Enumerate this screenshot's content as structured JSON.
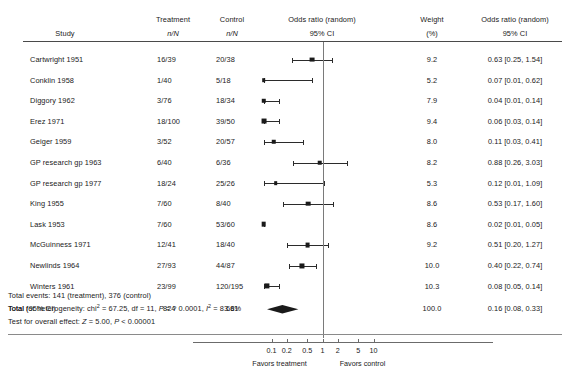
{
  "columns": {
    "study": "Study",
    "treatment_l1": "Treatment",
    "treatment_l2": "n/N",
    "control_l1": "Control",
    "control_l2": "n/N",
    "plot_l1": "Odds ratio (random)",
    "plot_l2": "95% CI",
    "weight_l1": "Weight",
    "weight_l2": "(%)",
    "or_l1": "Odds ratio (random)",
    "or_l2": "95% CI"
  },
  "rows": [
    {
      "study": "Cartwright 1951",
      "treatment": "16/39",
      "control": "20/38",
      "weight": "9.2",
      "or_text": "0.63 [0.25, 1.54]",
      "or": 0.63,
      "lcl": 0.25,
      "ucl": 1.54,
      "w": 9.2
    },
    {
      "study": "Conklin 1958",
      "treatment": "1/40",
      "control": "5/18",
      "weight": "5.2",
      "or_text": "0.07 [0.01, 0.62]",
      "or": 0.07,
      "lcl": 0.01,
      "ucl": 0.62,
      "w": 5.2
    },
    {
      "study": "Diggory 1962",
      "treatment": "3/76",
      "control": "18/34",
      "weight": "7.9",
      "or_text": "0.04 [0.01, 0.14]",
      "or": 0.04,
      "lcl": 0.01,
      "ucl": 0.14,
      "w": 7.9
    },
    {
      "study": "Erez 1971",
      "treatment": "18/100",
      "control": "39/50",
      "weight": "9.4",
      "or_text": "0.06 [0.03, 0.14]",
      "or": 0.06,
      "lcl": 0.03,
      "ucl": 0.14,
      "w": 9.4
    },
    {
      "study": "Geiger 1959",
      "treatment": "3/52",
      "control": "20/57",
      "weight": "8.0",
      "or_text": "0.11 [0.03, 0.41]",
      "or": 0.11,
      "lcl": 0.03,
      "ucl": 0.41,
      "w": 8.0
    },
    {
      "study": "GP research gp 1963",
      "treatment": "6/40",
      "control": "6/36",
      "weight": "8.2",
      "or_text": "0.88 [0.26, 3.03]",
      "or": 0.88,
      "lcl": 0.26,
      "ucl": 3.03,
      "w": 8.2
    },
    {
      "study": "GP research gp 1977",
      "treatment": "18/24",
      "control": "25/26",
      "weight": "5.3",
      "or_text": "0.12 [0.01, 1.09]",
      "or": 0.12,
      "lcl": 0.01,
      "ucl": 1.09,
      "w": 5.3
    },
    {
      "study": "King 1955",
      "treatment": "7/60",
      "control": "8/40",
      "weight": "8.6",
      "or_text": "0.53 [0.17, 1.60]",
      "or": 0.53,
      "lcl": 0.17,
      "ucl": 1.6,
      "w": 8.6
    },
    {
      "study": "Lask 1953",
      "treatment": "7/60",
      "control": "53/60",
      "weight": "8.6",
      "or_text": "0.02 [0.01, 0.05]",
      "or": 0.02,
      "lcl": 0.01,
      "ucl": 0.05,
      "w": 8.6
    },
    {
      "study": "McGuinness 1971",
      "treatment": "12/41",
      "control": "18/40",
      "weight": "9.2",
      "or_text": "0.51 [0.20, 1.27]",
      "or": 0.51,
      "lcl": 0.2,
      "ucl": 1.27,
      "w": 9.2
    },
    {
      "study": "Newlinds 1964",
      "treatment": "27/93",
      "control": "44/87",
      "weight": "10.0",
      "or_text": "0.40 [0.22, 0.74]",
      "or": 0.4,
      "lcl": 0.22,
      "ucl": 0.74,
      "w": 10.0
    },
    {
      "study": "Winters 1961",
      "treatment": "23/99",
      "control": "120/195",
      "weight": "10.3",
      "or_text": "0.08 [0.05, 0.14]",
      "or": 0.08,
      "lcl": 0.05,
      "ucl": 0.14,
      "w": 10.3
    }
  ],
  "total": {
    "label": "Total (95% CI)",
    "treatment": "824",
    "control": "681",
    "weight": "100.0",
    "or_text": "0.16 [0.08, 0.33]",
    "or": 0.16,
    "lcl": 0.08,
    "ucl": 0.33
  },
  "footnotes": {
    "events": "Total events: 141 (treatment), 376 (control)",
    "heterogeneity_pre": "Total for heterogeneity: chi",
    "heterogeneity_sup1": "2",
    "heterogeneity_mid": " = 67.25, df = 11, ",
    "heterogeneity_p_italic": "P",
    "heterogeneity_p_rest": " = ? 0.0001, ",
    "heterogeneity_i_italic": "I",
    "heterogeneity_sup2": "2",
    "heterogeneity_tail": " = 83.6%",
    "overall_pre": "Test for overall effect: ",
    "overall_z": "Z",
    "overall_mid": " = 5.00, ",
    "overall_p": "P",
    "overall_tail": " < 0.00001"
  },
  "axis": {
    "ticks": [
      "0.1",
      "0.2",
      "0.5",
      "1",
      "2",
      "5",
      "10"
    ],
    "tick_values": [
      0.1,
      0.2,
      0.5,
      1,
      2,
      5,
      10
    ],
    "left_caption": "Favors treatment",
    "right_caption": "Favors control",
    "xlim": [
      0.07,
      14
    ]
  },
  "chart_data": {
    "type": "forest",
    "title": "Odds ratio (random) 95% CI",
    "xlabel": "Odds ratio",
    "xscale": "log",
    "xlim": [
      0.07,
      14
    ],
    "ticks": [
      0.1,
      0.2,
      0.5,
      1,
      2,
      5,
      10
    ],
    "reference_line": 1,
    "categories": [
      "Cartwright 1951",
      "Conklin 1958",
      "Diggory 1962",
      "Erez 1971",
      "Geiger 1959",
      "GP research gp 1963",
      "GP research gp 1977",
      "King 1955",
      "Lask 1953",
      "McGuinness 1971",
      "Newlinds 1964",
      "Winters 1961"
    ],
    "effect": [
      0.63,
      0.07,
      0.04,
      0.06,
      0.11,
      0.88,
      0.12,
      0.53,
      0.02,
      0.51,
      0.4,
      0.08
    ],
    "lower_ci": [
      0.25,
      0.01,
      0.01,
      0.03,
      0.03,
      0.26,
      0.01,
      0.17,
      0.01,
      0.2,
      0.22,
      0.05
    ],
    "upper_ci": [
      1.54,
      0.62,
      0.14,
      0.14,
      0.41,
      3.03,
      1.09,
      1.6,
      0.05,
      1.27,
      0.74,
      0.14
    ],
    "weights": [
      9.2,
      5.2,
      7.9,
      9.4,
      8.0,
      8.2,
      5.3,
      8.6,
      8.6,
      9.2,
      10.0,
      10.3
    ],
    "pooled": {
      "effect": 0.16,
      "lower_ci": 0.08,
      "upper_ci": 0.33,
      "weight": 100.0
    },
    "legend": [
      "Favors treatment",
      "Favors control"
    ]
  },
  "geometry": {
    "col_study_x": 65,
    "col_treatment_x": 173,
    "col_control_x": 232,
    "col_weight_x": 432,
    "col_or_x": 515,
    "plot_center_x": 322.5,
    "row_start_y": 55,
    "row_step": 20.6
  }
}
